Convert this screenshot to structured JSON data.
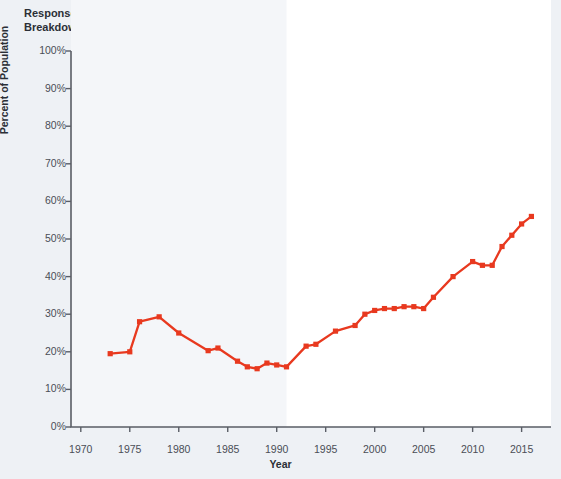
{
  "header": {
    "response_label": "Response:",
    "response_value": "Legal",
    "breakdown_label": "Breakdown:",
    "breakdown_value": "Total"
  },
  "legend": {
    "title": "Breakdown Category",
    "items": [
      {
        "label": "Total",
        "color": "#e8391f",
        "swatch": "legend-swatch"
      }
    ]
  },
  "colors": {
    "series": "#e8391f",
    "axis": "#5a5e66",
    "background": "#eef1f5",
    "plot_background": "#ffffff",
    "band": "#f4f6f9",
    "text": "#2b2f36"
  },
  "chart_data": {
    "type": "line",
    "title": "",
    "xlabel": "Year",
    "ylabel": "Percent of Population",
    "xlim": [
      1969,
      2018
    ],
    "ylim": [
      0,
      100
    ],
    "grid": false,
    "legend_position": "top-right",
    "xticks": [
      1970,
      1975,
      1980,
      1985,
      1990,
      1995,
      2000,
      2005,
      2010,
      2015
    ],
    "xtick_labels": [
      "1970",
      "1975",
      "1980",
      "1985",
      "1990",
      "1995",
      "2000",
      "2005",
      "2010",
      "2015"
    ],
    "yticks": [
      0,
      10,
      20,
      30,
      40,
      50,
      60,
      70,
      80,
      90,
      100
    ],
    "ytick_labels": [
      "0%",
      "10%",
      "20%",
      "30%",
      "40%",
      "50%",
      "60%",
      "70%",
      "80%",
      "90%",
      "100%"
    ],
    "series": [
      {
        "name": "Total",
        "color": "#e8391f",
        "marker": "square",
        "x": [
          1973,
          1975,
          1976,
          1978,
          1980,
          1983,
          1984,
          1986,
          1987,
          1988,
          1989,
          1990,
          1991,
          1993,
          1994,
          1996,
          1998,
          1999,
          2000,
          2001,
          2002,
          2003,
          2004,
          2005,
          2006,
          2008,
          2010,
          2011,
          2012,
          2013,
          2014,
          2015,
          2016
        ],
        "values": [
          19.5,
          20.0,
          28.0,
          29.3,
          25.0,
          20.3,
          21.0,
          17.5,
          16.0,
          15.5,
          17.0,
          16.5,
          16.0,
          21.5,
          22.0,
          25.5,
          27.0,
          30.0,
          31.0,
          31.5,
          31.5,
          32.0,
          32.0,
          31.5,
          34.5,
          40.0,
          44.0,
          43.0,
          43.0,
          48.0,
          51.0,
          54.0,
          56.0
        ]
      }
    ]
  }
}
